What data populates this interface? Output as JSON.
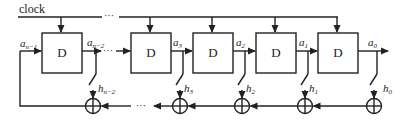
{
  "diagram": {
    "type": "linear feedback shift register",
    "clock_label": "clock",
    "ellipsis": "···",
    "registers": [
      {
        "label": "D",
        "output": "a",
        "output_sub": "n−2",
        "input": "a",
        "input_sub": "n−1",
        "tap": "h",
        "tap_sub": "n−2"
      },
      {
        "label": "D",
        "output": "a",
        "output_sub": "3",
        "tap": "h",
        "tap_sub": "3"
      },
      {
        "label": "D",
        "output": "a",
        "output_sub": "2",
        "tap": "h",
        "tap_sub": "2"
      },
      {
        "label": "D",
        "output": "a",
        "output_sub": "1",
        "tap": "h",
        "tap_sub": "1"
      },
      {
        "label": "D",
        "output": "a",
        "output_sub": "0",
        "tap": "h",
        "tap_sub": "0"
      }
    ],
    "adder_symbol": "⊕"
  }
}
